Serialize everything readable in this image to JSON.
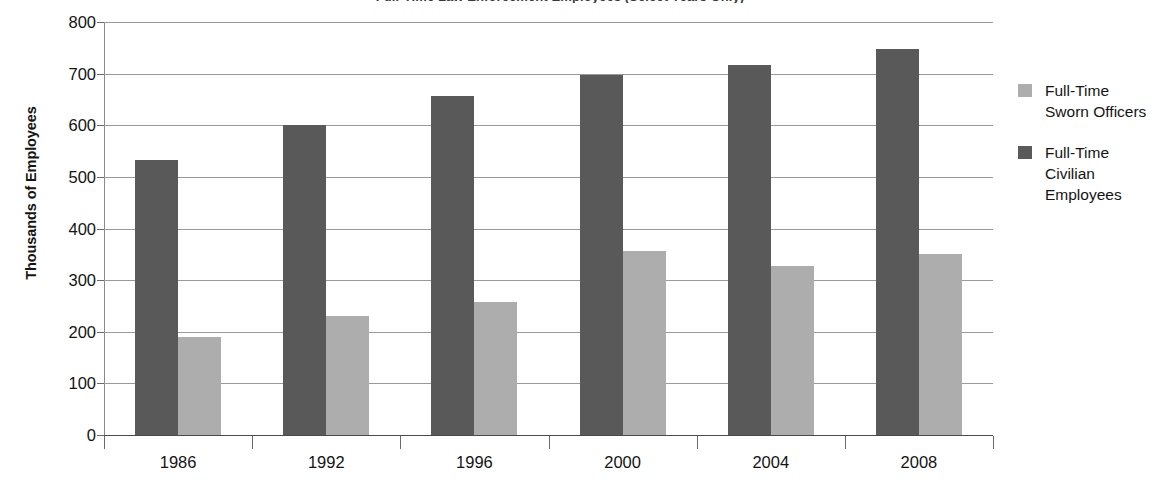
{
  "chart_data": {
    "type": "bar",
    "title": "Full-Time Law Enforcement Employees (Select Years Only)",
    "xlabel": "",
    "ylabel": "Thousands of Employees",
    "categories": [
      "1986",
      "1992",
      "1996",
      "2000",
      "2004",
      "2008"
    ],
    "series": [
      {
        "name": "Full-Time Civilian Employees",
        "color": "#595959",
        "values": [
          533,
          600,
          656,
          697,
          716,
          747
        ]
      },
      {
        "name": "Full-Time Sworn Officers",
        "color": "#adadad",
        "values": [
          190,
          230,
          258,
          356,
          328,
          350
        ]
      }
    ],
    "ylim": [
      0,
      800
    ],
    "yticks": [
      0,
      100,
      200,
      300,
      400,
      500,
      600,
      700,
      800
    ],
    "ytick_labels": [
      "0",
      "100",
      "200",
      "300",
      "400",
      "500",
      "600",
      "700",
      "800"
    ],
    "grid": true,
    "legend_position": "right",
    "legend": [
      {
        "label_lines": [
          "Full-Time",
          "Sworn Officers"
        ],
        "swatch": "light"
      },
      {
        "label_lines": [
          "Full-Time",
          "Civilian",
          "Employees"
        ],
        "swatch": "dark"
      }
    ]
  },
  "axis": {
    "y_title": "Thousands of Employees"
  },
  "legend": {
    "entry0_line0": "Full-Time",
    "entry0_line1": "Sworn Officers",
    "entry1_line0": "Full-Time",
    "entry1_line1": "Civilian",
    "entry1_line2": "Employees"
  },
  "colors": {
    "dark_bar": "#595959",
    "light_bar": "#adadad",
    "gridline": "#9a9a9a",
    "axis": "#4a4a4a",
    "text": "#141414",
    "background": "#ffffff"
  }
}
